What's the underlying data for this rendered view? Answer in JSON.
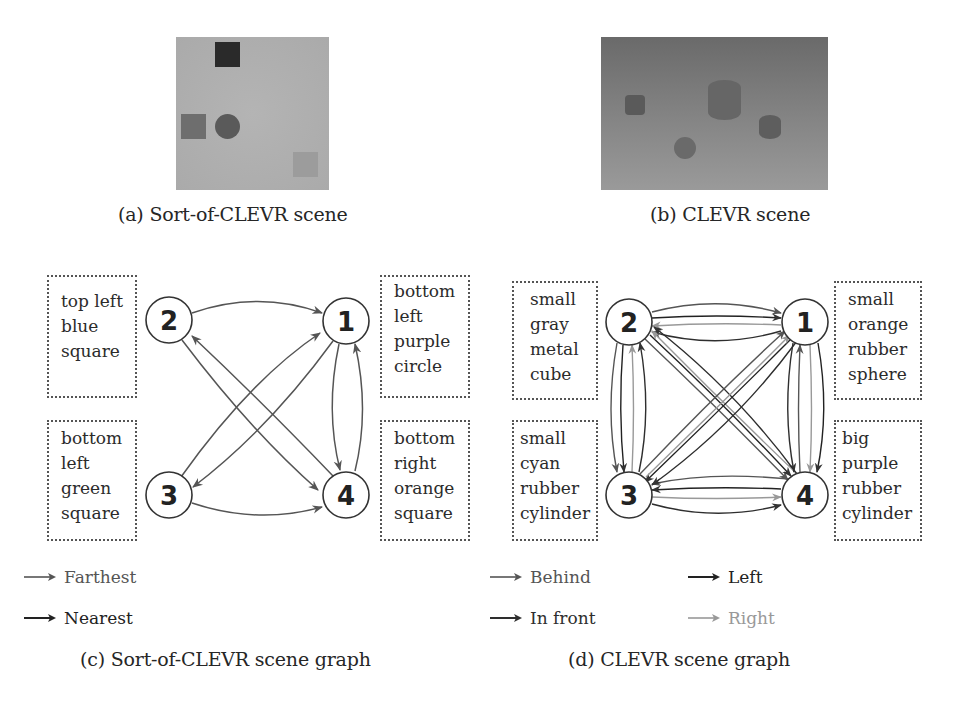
{
  "figure": {
    "panel_a": {
      "caption": "(a) Sort-of-CLEVR scene",
      "scene": {
        "background_color": "#aeaeae",
        "objects": [
          {
            "shape": "square",
            "color": "#2a2a2a",
            "position": "top"
          },
          {
            "shape": "square",
            "color": "#6e6e6e",
            "position": "left-middle"
          },
          {
            "shape": "circle",
            "color": "#5a5a5a",
            "position": "middle-left"
          },
          {
            "shape": "square",
            "color": "#9c9c9c",
            "position": "bottom-right"
          }
        ]
      }
    },
    "panel_b": {
      "caption": "(b) CLEVR scene",
      "scene": {
        "background_color": "#7a7a7a",
        "objects": [
          {
            "shape": "cube",
            "color": "#5a5a5a"
          },
          {
            "shape": "cylinder",
            "color": "#666666",
            "size": "big"
          },
          {
            "shape": "cylinder",
            "color": "#5e5e5e"
          },
          {
            "shape": "sphere",
            "color": "#6a6a6a"
          }
        ]
      }
    },
    "panel_c": {
      "caption": "(c) Sort-of-CLEVR scene graph",
      "nodes": [
        {
          "id": "1",
          "label": "1",
          "description": [
            "bottom",
            "left",
            "purple",
            "circle"
          ]
        },
        {
          "id": "2",
          "label": "2",
          "description": [
            "top left",
            "blue",
            "square"
          ]
        },
        {
          "id": "3",
          "label": "3",
          "description": [
            "bottom",
            "left",
            "green",
            "square"
          ]
        },
        {
          "id": "4",
          "label": "4",
          "description": [
            "bottom",
            "right",
            "orange",
            "square"
          ]
        }
      ],
      "legend": [
        {
          "label": "Farthest",
          "color": "#555555"
        },
        {
          "label": "Nearest",
          "color": "#222222"
        }
      ]
    },
    "panel_d": {
      "caption": "(d) CLEVR scene graph",
      "nodes": [
        {
          "id": "1",
          "label": "1",
          "description": [
            "small",
            "orange",
            "rubber",
            "sphere"
          ]
        },
        {
          "id": "2",
          "label": "2",
          "description": [
            "small",
            "gray",
            "metal",
            "cube"
          ]
        },
        {
          "id": "3",
          "label": "3",
          "description": [
            "small",
            "cyan",
            "rubber",
            "cylinder"
          ]
        },
        {
          "id": "4",
          "label": "4",
          "description": [
            "big",
            "purple",
            "rubber",
            "cylinder"
          ]
        }
      ],
      "legend": [
        {
          "label": "Behind",
          "color": "#555555"
        },
        {
          "label": "Left",
          "color": "#222222"
        },
        {
          "label": "In front",
          "color": "#2e2e2e"
        },
        {
          "label": "Right",
          "color": "#9a9a9a"
        }
      ]
    }
  }
}
